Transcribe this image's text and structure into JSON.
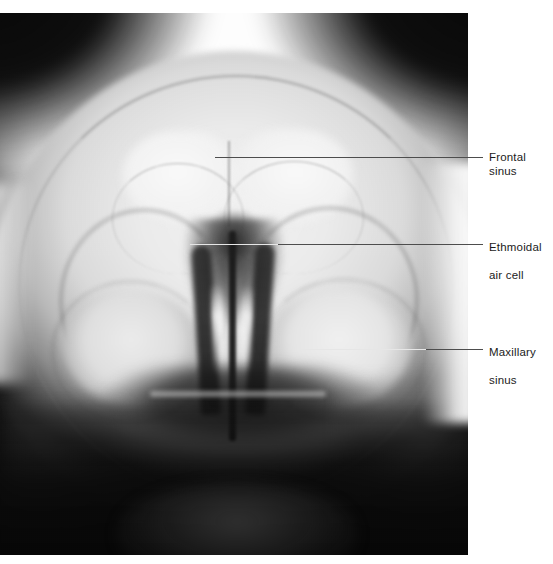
{
  "figure": {
    "type": "radiograph",
    "modality": "plain film X-ray",
    "view": "occipitomental (Waters) view of the paranasal sinuses",
    "caption": ""
  },
  "annotations": [
    {
      "id": "frontal-sinus",
      "label": "Frontal sinus",
      "label_line1": "Frontal sinus",
      "label_line2": "",
      "leader": {
        "x_start": 215,
        "x_end": 483,
        "y": 157
      },
      "label_pos": {
        "x": 489,
        "y": 150
      }
    },
    {
      "id": "ethmoidal-air-cell",
      "label": "Ethmoidal air cell",
      "label_line1": "Ethmoidal",
      "label_line2": "air cell",
      "leader": {
        "x_start": 190,
        "x_end": 483,
        "y": 244
      },
      "label_pos": {
        "x": 489,
        "y": 226
      }
    },
    {
      "id": "maxillary-sinus",
      "label": "Maxillary sinus",
      "label_line1": "Maxillary",
      "label_line2": "sinus",
      "leader": {
        "x_start": 300,
        "x_end": 483,
        "y": 349
      },
      "label_pos": {
        "x": 489,
        "y": 331
      }
    }
  ],
  "colors": {
    "leader_dark": "#4d4d4d",
    "leader_light": "#e6e6e6",
    "label_text": "#1b1b1b",
    "page_background": "#ffffff",
    "film_dark": "#0a0a0a",
    "film_bright": "#ffffff"
  },
  "plate": {
    "x": 0,
    "y": 13,
    "width": 468,
    "height": 542
  }
}
